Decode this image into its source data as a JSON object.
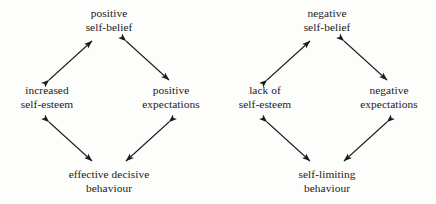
{
  "figure": {
    "type": "cycle-diagram-pair",
    "background_color": "#fdfdfb",
    "ink_color": "#1b1b1b",
    "arrow_style": "double-headed"
  },
  "diagrams": [
    {
      "id": "positive-cycle",
      "name": "positive self-belief cycle",
      "nodes": {
        "top": {
          "name": "positive-self-belief",
          "line1": "positive",
          "line2": "self-belief"
        },
        "left": {
          "name": "increased-self-esteem",
          "line1": "increased",
          "line2": "self-esteem"
        },
        "right": {
          "name": "positive-expectations",
          "line1": "positive",
          "line2": "expectations"
        },
        "bottom": {
          "name": "effective-decisive-behaviour",
          "line1": "effective decisive",
          "line2": "behaviour"
        }
      },
      "edges": [
        {
          "from": "top",
          "to": "left",
          "arrowheads": "both"
        },
        {
          "from": "top",
          "to": "right",
          "arrowheads": "both"
        },
        {
          "from": "left",
          "to": "bottom",
          "arrowheads": "both"
        },
        {
          "from": "right",
          "to": "bottom",
          "arrowheads": "both"
        }
      ]
    },
    {
      "id": "negative-cycle",
      "name": "negative self-belief cycle",
      "nodes": {
        "top": {
          "name": "negative-self-belief",
          "line1": "negative",
          "line2": "self-belief"
        },
        "left": {
          "name": "lack-of-self-esteem",
          "line1": "lack of",
          "line2": "self-esteem"
        },
        "right": {
          "name": "negative-expectations",
          "line1": "negative",
          "line2": "expectations"
        },
        "bottom": {
          "name": "self-limiting-behaviour",
          "line1": "self-limiting",
          "line2": "behaviour"
        }
      },
      "edges": [
        {
          "from": "top",
          "to": "left",
          "arrowheads": "both"
        },
        {
          "from": "top",
          "to": "right",
          "arrowheads": "both"
        },
        {
          "from": "left",
          "to": "bottom",
          "arrowheads": "both"
        },
        {
          "from": "right",
          "to": "bottom",
          "arrowheads": "both"
        }
      ]
    }
  ]
}
